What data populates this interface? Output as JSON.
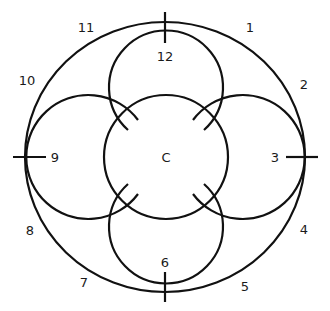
{
  "diagram": {
    "center_label": "C",
    "outer_ring_labels": [
      {
        "text": "1",
        "x": 250,
        "y": 27
      },
      {
        "text": "2",
        "x": 304,
        "y": 84
      },
      {
        "text": "4",
        "x": 304,
        "y": 229
      },
      {
        "text": "5",
        "x": 245,
        "y": 286
      },
      {
        "text": "7",
        "x": 84,
        "y": 282
      },
      {
        "text": "8",
        "x": 30,
        "y": 230
      },
      {
        "text": "10",
        "x": 27,
        "y": 80
      },
      {
        "text": "11",
        "x": 86,
        "y": 27
      }
    ],
    "petal_labels": {
      "top": "12",
      "right": "3",
      "bottom": "6",
      "left": "9"
    },
    "colors": {
      "line": "#111111",
      "background": "#ffffff"
    }
  }
}
